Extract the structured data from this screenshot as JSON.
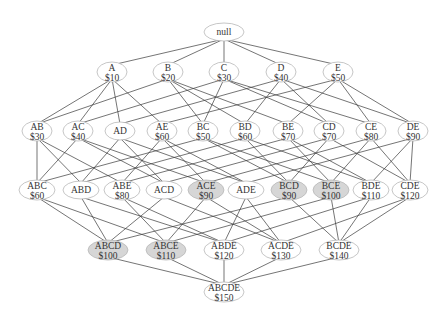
{
  "diagram": {
    "colors": {
      "edge": "#3a3a3a",
      "node_stroke": "#b8b8b8",
      "node_fill": "#ffffff",
      "highlight_fill": "#d6d6d6",
      "text": "#333333"
    },
    "nodes": [
      {
        "id": "null",
        "label": "null",
        "value": "",
        "x": 224,
        "y": 32,
        "highlight": false
      },
      {
        "id": "A",
        "label": "A",
        "value": "$10",
        "x": 112,
        "y": 72,
        "highlight": false
      },
      {
        "id": "B",
        "label": "B",
        "value": "$20",
        "x": 168,
        "y": 72,
        "highlight": false
      },
      {
        "id": "C",
        "label": "C",
        "value": "$30",
        "x": 224,
        "y": 72,
        "highlight": false
      },
      {
        "id": "D",
        "label": "D",
        "value": "$40",
        "x": 281,
        "y": 72,
        "highlight": false
      },
      {
        "id": "E",
        "label": "E",
        "value": "$50",
        "x": 338,
        "y": 72,
        "highlight": false
      },
      {
        "id": "AB",
        "label": "AB",
        "value": "$30",
        "x": 37,
        "y": 131,
        "highlight": false
      },
      {
        "id": "AC",
        "label": "AC",
        "value": "$40",
        "x": 78,
        "y": 131,
        "highlight": false
      },
      {
        "id": "AD",
        "label": "AD",
        "value": "",
        "x": 120,
        "y": 131,
        "highlight": false
      },
      {
        "id": "AE",
        "label": "AE",
        "value": "$60",
        "x": 162,
        "y": 131,
        "highlight": false
      },
      {
        "id": "BC",
        "label": "BC",
        "value": "$50",
        "x": 203,
        "y": 131,
        "highlight": false
      },
      {
        "id": "BD",
        "label": "BD",
        "value": "$60",
        "x": 245,
        "y": 131,
        "highlight": false
      },
      {
        "id": "BE",
        "label": "BE",
        "value": "$70",
        "x": 288,
        "y": 131,
        "highlight": false
      },
      {
        "id": "CD",
        "label": "CD",
        "value": "$70",
        "x": 329,
        "y": 131,
        "highlight": false
      },
      {
        "id": "CE",
        "label": "CE",
        "value": "$80",
        "x": 371,
        "y": 131,
        "highlight": false
      },
      {
        "id": "DE",
        "label": "DE",
        "value": "$90",
        "x": 413,
        "y": 131,
        "highlight": false
      },
      {
        "id": "ABC",
        "label": "ABC",
        "value": "$60",
        "x": 37,
        "y": 190,
        "highlight": false
      },
      {
        "id": "ABD",
        "label": "ABD",
        "value": "",
        "x": 81,
        "y": 190,
        "highlight": false
      },
      {
        "id": "ABE",
        "label": "ABE",
        "value": "$80",
        "x": 122,
        "y": 190,
        "highlight": false
      },
      {
        "id": "ACD",
        "label": "ACD",
        "value": "",
        "x": 164,
        "y": 190,
        "highlight": false
      },
      {
        "id": "ACE",
        "label": "ACE",
        "value": "$90",
        "x": 206,
        "y": 190,
        "highlight": true
      },
      {
        "id": "ADE",
        "label": "ADE",
        "value": "",
        "x": 246,
        "y": 190,
        "highlight": false
      },
      {
        "id": "BCD",
        "label": "BCD",
        "value": "$90",
        "x": 289,
        "y": 190,
        "highlight": true
      },
      {
        "id": "BCE",
        "label": "BCE",
        "value": "$100",
        "x": 331,
        "y": 190,
        "highlight": true
      },
      {
        "id": "BDE",
        "label": "BDE",
        "value": "$110",
        "x": 371,
        "y": 190,
        "highlight": false
      },
      {
        "id": "CDE",
        "label": "CDE",
        "value": "$120",
        "x": 410,
        "y": 190,
        "highlight": false
      },
      {
        "id": "ABCD",
        "label": "ABCD",
        "value": "$100",
        "x": 108,
        "y": 250,
        "highlight": true
      },
      {
        "id": "ABCE",
        "label": "ABCE",
        "value": "$110",
        "x": 166,
        "y": 250,
        "highlight": true
      },
      {
        "id": "ABDE",
        "label": "ABDE",
        "value": "$120",
        "x": 224,
        "y": 250,
        "highlight": false
      },
      {
        "id": "ACDE",
        "label": "ACDE",
        "value": "$130",
        "x": 281,
        "y": 250,
        "highlight": false
      },
      {
        "id": "BCDE",
        "label": "BCDE",
        "value": "$140",
        "x": 339,
        "y": 250,
        "highlight": false
      },
      {
        "id": "ABCDE",
        "label": "ABCDE",
        "value": "$150",
        "x": 224,
        "y": 292,
        "highlight": false
      }
    ]
  }
}
